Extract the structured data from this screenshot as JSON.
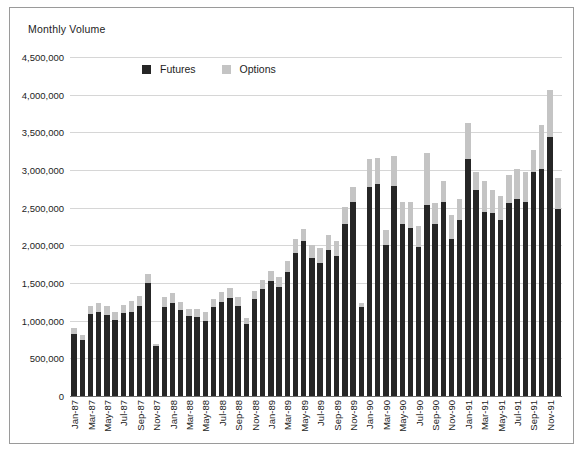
{
  "axis_title": "Monthly Volume",
  "legend": [
    {
      "label": "Futures",
      "color": "#262626",
      "icon": "square-swatch-icon"
    },
    {
      "label": "Options",
      "color": "#c4c4c4",
      "icon": "square-swatch-icon"
    }
  ],
  "colors": {
    "futures": "#262626",
    "options": "#c4c4c4",
    "gridline": "#d6d6d6",
    "axis": "#6e6e6e",
    "frame": "#9a9a9a",
    "text": "#1d1d1d",
    "background": "#ffffff"
  },
  "chart_data": {
    "type": "bar",
    "stacked": true,
    "title": "",
    "subtitle": "",
    "xlabel": "",
    "ylabel": "Monthly Volume",
    "ylim": [
      0,
      4500000
    ],
    "ytick_step": 500000,
    "ytick_labels": [
      "4,500,000",
      "4,000,000",
      "3,500,000",
      "3,000,000",
      "2,500,000",
      "2,000,000",
      "1,500,000",
      "1,000,000",
      "500,000",
      "0"
    ],
    "ytick_values": [
      4500000,
      4000000,
      3500000,
      3000000,
      2500000,
      2000000,
      1500000,
      1000000,
      500000,
      0
    ],
    "grid": true,
    "legend_position": "top-center",
    "x_label_rotation": -90,
    "x_label_interval": 2,
    "categories": [
      "Jan-87",
      "Feb-87",
      "Mar-87",
      "Apr-87",
      "May-87",
      "Jun-87",
      "Jul-87",
      "Aug-87",
      "Sep-87",
      "Oct-87",
      "Nov-87",
      "Dec-87",
      "Jan-88",
      "Feb-88",
      "Mar-88",
      "Apr-88",
      "May-88",
      "Jun-88",
      "Jul-88",
      "Aug-88",
      "Sep-88",
      "Oct-88",
      "Nov-88",
      "Dec-88",
      "Jan-89",
      "Feb-89",
      "Mar-89",
      "Apr-89",
      "May-89",
      "Jun-89",
      "Jul-89",
      "Aug-89",
      "Sep-89",
      "Oct-89",
      "Nov-89",
      "Dec-89",
      "Jan-90",
      "Feb-90",
      "Mar-90",
      "Apr-90",
      "May-90",
      "Jun-90",
      "Jul-90",
      "Aug-90",
      "Sep-90",
      "Oct-90",
      "Nov-90",
      "Dec-90",
      "Jan-91",
      "Feb-91",
      "Mar-91",
      "Apr-91",
      "May-91",
      "Jun-91",
      "Jul-91",
      "Aug-91",
      "Sep-91",
      "Oct-91",
      "Nov-91",
      "Dec-91"
    ],
    "tick_labels_shown": [
      "Jan-87",
      "Mar-87",
      "May-87",
      "Jul-87",
      "Sep-87",
      "Nov-87",
      "Jan-88",
      "Mar-88",
      "May-88",
      "Jul-88",
      "Sep-88",
      "Nov-88",
      "Jan-89",
      "Mar-89",
      "May-89",
      "Jul-89",
      "Sep-89",
      "Nov-89",
      "Jan-90",
      "Mar-90",
      "May-90",
      "Jul-90",
      "Sep-90",
      "Nov-90",
      "Jan-91",
      "Mar-91",
      "May-91",
      "Jul-91",
      "Sep-91",
      "Nov-91"
    ],
    "series": [
      {
        "name": "Futures",
        "color": "#262626",
        "values": [
          820000,
          750000,
          1090000,
          1110000,
          1080000,
          1010000,
          1100000,
          1110000,
          1190000,
          1500000,
          660000,
          1180000,
          1240000,
          1140000,
          1060000,
          1050000,
          1000000,
          1180000,
          1250000,
          1300000,
          1190000,
          960000,
          1290000,
          1420000,
          1530000,
          1450000,
          1640000,
          1900000,
          2060000,
          1830000,
          1760000,
          1940000,
          1860000,
          2290000,
          2570000,
          1180000,
          2770000,
          2810000,
          2000000,
          2790000,
          2280000,
          2230000,
          1980000,
          2530000,
          2280000,
          2580000,
          2080000,
          2340000,
          3140000,
          2740000,
          2440000,
          2430000,
          2330000,
          2560000,
          2620000,
          2580000,
          2980000,
          3010000,
          3440000,
          2480000
        ]
      },
      {
        "name": "Options",
        "color": "#c4c4c4",
        "values": [
          80000,
          60000,
          110000,
          120000,
          110000,
          100000,
          110000,
          150000,
          140000,
          120000,
          30000,
          140000,
          130000,
          110000,
          90000,
          100000,
          120000,
          110000,
          130000,
          140000,
          130000,
          80000,
          110000,
          120000,
          130000,
          130000,
          150000,
          180000,
          160000,
          180000,
          200000,
          200000,
          200000,
          220000,
          200000,
          60000,
          380000,
          350000,
          200000,
          400000,
          290000,
          340000,
          280000,
          700000,
          280000,
          270000,
          320000,
          280000,
          480000,
          240000,
          420000,
          310000,
          330000,
          380000,
          400000,
          400000,
          280000,
          590000,
          620000,
          410000
        ]
      }
    ]
  }
}
